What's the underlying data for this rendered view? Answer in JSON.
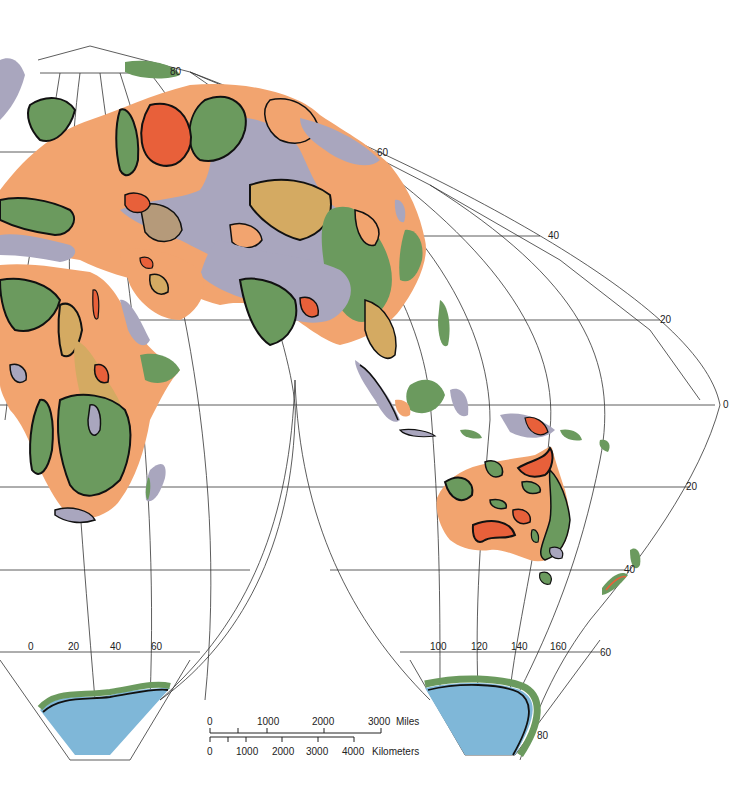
{
  "map": {
    "projection": "interrupted world projection (Eurasia / Africa / Australia lobes)",
    "colors": {
      "orange": "#f2a46f",
      "red": "#e8603a",
      "green": "#6b9a5e",
      "gray": "#a9a6be",
      "tan": "#d4aa62",
      "brown": "#b59a7a",
      "ocean_ice": "#7fb7d8",
      "grid": "#333333"
    },
    "latitude_labels": {
      "n80": "80",
      "n60": "60",
      "n40": "40",
      "n20": "20",
      "eq": "0",
      "s20": "20",
      "s40": "40",
      "s60": "60",
      "s80": "80"
    },
    "longitude_labels_left": [
      "0",
      "20",
      "40",
      "60"
    ],
    "longitude_labels_right": [
      "100",
      "120",
      "140",
      "160"
    ]
  },
  "scale_bar": {
    "miles_ticks": [
      "0",
      "1000",
      "2000",
      "3000"
    ],
    "miles_unit": "Miles",
    "km_ticks": [
      "0",
      "1000",
      "2000",
      "3000",
      "4000"
    ],
    "km_unit": "Kilometers"
  }
}
